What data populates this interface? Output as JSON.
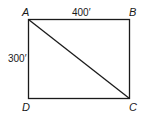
{
  "diagram": {
    "type": "rectangle-with-diagonal",
    "vertices": [
      {
        "label": "A",
        "position": "top-left"
      },
      {
        "label": "B",
        "position": "top-right"
      },
      {
        "label": "C",
        "position": "bottom-right"
      },
      {
        "label": "D",
        "position": "bottom-left"
      }
    ],
    "dimensions": {
      "top": "400′",
      "left": "300′"
    },
    "diagonal": {
      "from": "A",
      "to": "C"
    },
    "stroke_color": "#1a1a1a"
  }
}
